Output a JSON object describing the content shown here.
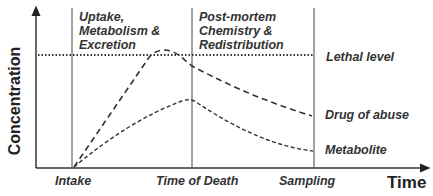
{
  "diagram": {
    "y_axis_label": "Concentration",
    "x_axis_label": "Time",
    "phases": [
      {
        "lines": [
          "Uptake,",
          "Metabolism &",
          "Excretion"
        ]
      },
      {
        "lines": [
          "Post-mortem",
          "Chemistry &",
          "Redistribution"
        ]
      }
    ],
    "x_markers": [
      "Intake",
      "Time of Death",
      "Sampling"
    ],
    "curves": {
      "lethal": "Lethal  level",
      "drug": "Drug of abuse",
      "metabolite": "Metabolite"
    },
    "colors": {
      "line": "#333333",
      "text": "#333333"
    }
  }
}
